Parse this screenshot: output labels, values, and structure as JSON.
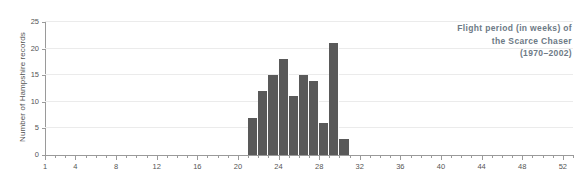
{
  "chart_data": {
    "type": "bar",
    "title_lines": [
      "Flight period (in weeks) of",
      "the Scarce Chaser",
      "(1970–2002)"
    ],
    "xlabel": "",
    "ylabel": "Number of Hampshire records",
    "xlim": [
      1,
      53
    ],
    "ylim": [
      0,
      25
    ],
    "grid": true,
    "legend": null,
    "bar_color": "#595959",
    "grid_color": "#ebebeb",
    "axis_color": "#9a9a9a",
    "text_color": "#555555",
    "title_color": "#6d7a86",
    "x_tick_labels": [
      "1",
      "4",
      "8",
      "12",
      "16",
      "20",
      "24",
      "28",
      "32",
      "36",
      "40",
      "44",
      "48",
      "52"
    ],
    "x_tick_values": [
      1,
      4,
      8,
      12,
      16,
      20,
      24,
      28,
      32,
      36,
      40,
      44,
      48,
      52
    ],
    "y_tick_labels": [
      "0",
      "5",
      "10",
      "15",
      "20",
      "25"
    ],
    "y_tick_values": [
      0,
      5,
      10,
      15,
      20,
      25
    ],
    "x": [
      21,
      22,
      23,
      24,
      25,
      26,
      27,
      28,
      29,
      30
    ],
    "values": [
      7,
      12,
      15,
      18,
      11,
      15,
      14,
      6,
      21,
      3
    ],
    "categories": [
      "21",
      "22",
      "23",
      "24",
      "25",
      "26",
      "27",
      "28",
      "29",
      "30"
    ],
    "bars": [
      {
        "week": 21,
        "records": 7
      },
      {
        "week": 22,
        "records": 12
      },
      {
        "week": 23,
        "records": 15
      },
      {
        "week": 24,
        "records": 18
      },
      {
        "week": 25,
        "records": 11
      },
      {
        "week": 26,
        "records": 15
      },
      {
        "week": 27,
        "records": 14
      },
      {
        "week": 28,
        "records": 6
      },
      {
        "week": 29,
        "records": 21
      },
      {
        "week": 30,
        "records": 3
      }
    ]
  }
}
